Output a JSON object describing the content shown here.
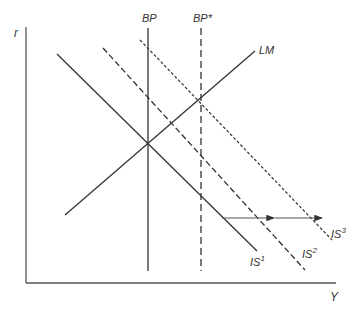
{
  "diagram": {
    "type": "IS-LM-BP diagram",
    "axes": {
      "y_label": "r",
      "x_label": "Y"
    },
    "curves": [
      {
        "id": "BP",
        "label": "BP",
        "style": "solid",
        "orientation": "vertical"
      },
      {
        "id": "BPstar",
        "label": "BP*",
        "style": "dashed",
        "orientation": "vertical"
      },
      {
        "id": "LM",
        "label": "LM",
        "style": "solid",
        "slope": "upward"
      },
      {
        "id": "IS1",
        "label": "IS",
        "superscript": "1",
        "style": "solid",
        "slope": "downward"
      },
      {
        "id": "IS2",
        "label": "IS",
        "superscript": "2",
        "style": "dashed",
        "slope": "downward"
      },
      {
        "id": "IS3",
        "label": "IS",
        "superscript": "3",
        "style": "dotted",
        "slope": "downward"
      }
    ],
    "arrows": [
      {
        "from": "IS1",
        "to": "IS2",
        "direction": "right"
      },
      {
        "from": "IS2",
        "to": "IS3",
        "direction": "right"
      }
    ],
    "colors": {
      "line": "#333333",
      "axis": "#555555",
      "background": "#ffffff"
    }
  }
}
